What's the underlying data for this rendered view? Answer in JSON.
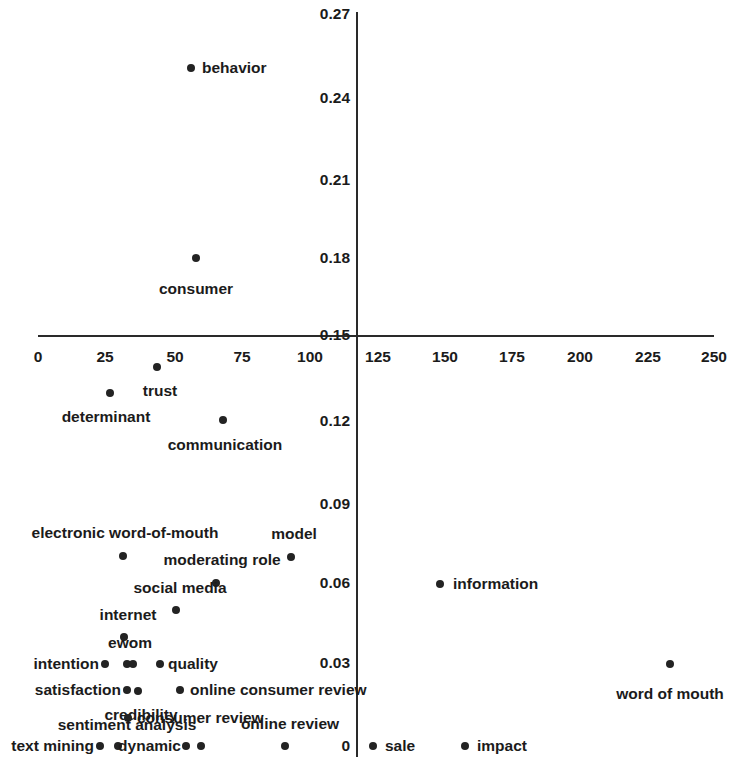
{
  "chart_data": {
    "type": "scatter",
    "title": "",
    "subtitle": "",
    "xlabel": "",
    "ylabel": "",
    "xlim": [
      0,
      250
    ],
    "ylim": [
      0,
      0.27
    ],
    "grid": false,
    "legend": "none",
    "xticks": [
      0,
      25,
      50,
      75,
      100,
      125,
      150,
      175,
      200,
      225,
      250
    ],
    "xtick_labels": [
      "0",
      "25",
      "50",
      "75",
      "100",
      "125",
      "150",
      "175",
      "200",
      "225",
      "250"
    ],
    "yticks": [
      0,
      0.03,
      0.06,
      0.09,
      0.12,
      0.15,
      0.18,
      0.21,
      0.24,
      0.27
    ],
    "ytick_labels": [
      "0",
      "0.03",
      "0.06",
      "0.09",
      "0.12",
      "0.15",
      "0.18",
      "0.21",
      "0.24",
      "0.27"
    ],
    "x_axis_crossing_y": 0.15,
    "y_axis_crossing_x": 116,
    "marker": "filled-circle",
    "marker_color": "#232323",
    "points": [
      {
        "label": "behavior",
        "x": 56.6,
        "y": 0.2524,
        "lx": 191,
        "ly": 68,
        "tx": 202,
        "ty": 68,
        "pos": "right"
      },
      {
        "label": "consumer",
        "x": 58.4,
        "y": 0.1804,
        "lx": 196,
        "ly": 258,
        "tx": 196,
        "ty": 281,
        "pos": "below"
      },
      {
        "label": "trust",
        "x": 44.0,
        "y": 0.1445,
        "lx": 157,
        "ly": 367,
        "tx": 160,
        "ty": 383,
        "pos": "below"
      },
      {
        "label": "determinant",
        "x": 26.6,
        "y": 0.1393,
        "lx": 110,
        "ly": 393,
        "tx": 106,
        "ty": 409,
        "pos": "below"
      },
      {
        "label": "communication",
        "x": 68.4,
        "y": 0.134,
        "lx": 223,
        "ly": 420,
        "tx": 225,
        "ty": 437,
        "pos": "below"
      },
      {
        "label": "electronic word-of-mouth",
        "x": 31.4,
        "y": 0.0773,
        "lx": 123,
        "ly": 556,
        "tx": 125,
        "ty": 540,
        "pos": "above"
      },
      {
        "label": "model",
        "x": 93.5,
        "y": 0.0771,
        "lx": 291,
        "ly": 557,
        "tx": 294,
        "ty": 541,
        "pos": "above"
      },
      {
        "label": "moderating role",
        "x": 65.8,
        "y": 0.0722,
        "lx": 216,
        "ly": 583,
        "tx": 222,
        "ty": 567,
        "pos": "above"
      },
      {
        "label": "social media",
        "x": 51.0,
        "y": 0.067,
        "lx": 176,
        "ly": 610,
        "tx": 180,
        "ty": 595,
        "pos": "above"
      },
      {
        "label": "information",
        "x": 148.8,
        "y": 0.0715,
        "lx": 440,
        "ly": 584,
        "tx": 453,
        "ty": 584,
        "pos": "right"
      },
      {
        "label": "internet",
        "x": 43.3,
        "y": 0.062,
        "lx": 124,
        "ly": 637,
        "tx": 128,
        "ty": 622,
        "pos": "above"
      },
      {
        "label": "ewom",
        "x": 40.0,
        "y": 0.057,
        "lx": 127,
        "ly": 664,
        "tx": 130,
        "ty": 650,
        "pos": "above"
      },
      {
        "label": "intention",
        "x": 24.8,
        "y": 0.057,
        "lx": 105,
        "ly": 664,
        "tx": 99,
        "ty": 664,
        "pos": "left"
      },
      {
        "label": "",
        "x": 42.2,
        "y": 0.057,
        "lx": 133,
        "ly": 664,
        "tx": 0,
        "ty": 0,
        "pos": "none"
      },
      {
        "label": "quality",
        "x": 45.1,
        "y": 0.057,
        "lx": 160,
        "ly": 664,
        "tx": 168,
        "ty": 664,
        "pos": "right"
      },
      {
        "label": "satisfaction",
        "x": 32.1,
        "y": 0.0507,
        "lx": 127,
        "ly": 690,
        "tx": 121,
        "ty": 690,
        "pos": "left"
      },
      {
        "label": "credibility",
        "x": 35.0,
        "y": 0.0505,
        "lx": 138,
        "ly": 691,
        "tx": 141,
        "ty": 707,
        "pos": "below"
      },
      {
        "label": "online consumer review",
        "x": 57.0,
        "y": 0.0505,
        "lx": 180,
        "ly": 690,
        "tx": 190,
        "ty": 690,
        "pos": "right"
      },
      {
        "label": "consumer review",
        "x": 33.1,
        "y": 0.044,
        "lx": 128,
        "ly": 718,
        "tx": 137,
        "ty": 718,
        "pos": "right"
      },
      {
        "label": "online review",
        "x": 90.0,
        "y": 0.0395,
        "lx": 285,
        "ly": 746,
        "tx": 290,
        "ty": 731,
        "pos": "above"
      },
      {
        "label": "sentiment analysis",
        "x": 27.5,
        "y": 0.038,
        "lx": 118,
        "ly": 746,
        "tx": 127,
        "ty": 732,
        "pos": "above"
      },
      {
        "label": "text mining",
        "x": 21.1,
        "y": 0.0375,
        "lx": 100,
        "ly": 746,
        "tx": 94,
        "ty": 746,
        "pos": "left"
      },
      {
        "label": "dynamic",
        "x": 54.0,
        "y": 0.0375,
        "lx": 186,
        "ly": 746,
        "tx": 181,
        "ty": 746,
        "pos": "left"
      },
      {
        "label": "",
        "x": 59.4,
        "y": 0.0375,
        "lx": 201,
        "ly": 746,
        "tx": 0,
        "ty": 0,
        "pos": "none"
      },
      {
        "label": "word of mouth",
        "x": 230.5,
        "y": 0.0297,
        "lx": 670,
        "ly": 664,
        "tx": 670,
        "ty": 686,
        "pos": "below"
      },
      {
        "label": "sale",
        "x": 124.0,
        "y": 0.0,
        "lx": 373,
        "ly": 746,
        "tx": 385,
        "ty": 746,
        "pos": "right"
      },
      {
        "label": "impact",
        "x": 158.0,
        "y": 0.0,
        "lx": 465,
        "ly": 746,
        "tx": 477,
        "ty": 746,
        "pos": "right"
      }
    ]
  },
  "axes": {
    "x_ticks": [
      {
        "label": "0",
        "px": 38
      },
      {
        "label": "25",
        "px": 105
      },
      {
        "label": "50",
        "px": 175
      },
      {
        "label": "75",
        "px": 242
      },
      {
        "label": "100",
        "px": 310
      },
      {
        "label": "125",
        "px": 378
      },
      {
        "label": "150",
        "px": 445
      },
      {
        "label": "175",
        "px": 512
      },
      {
        "label": "200",
        "px": 580
      },
      {
        "label": "225",
        "px": 648
      },
      {
        "label": "250",
        "px": 714
      }
    ],
    "y_ticks": [
      {
        "label": "0.27",
        "py": 14
      },
      {
        "label": "0.24",
        "py": 98
      },
      {
        "label": "0.21",
        "py": 180
      },
      {
        "label": "0.18",
        "py": 258
      },
      {
        "label": "0.15",
        "py": 335
      },
      {
        "label": "0.12",
        "py": 421
      },
      {
        "label": "0.09",
        "py": 504
      },
      {
        "label": "0.06",
        "py": 583
      },
      {
        "label": "0.03",
        "py": 663
      },
      {
        "label": "0",
        "py": 746
      }
    ]
  }
}
